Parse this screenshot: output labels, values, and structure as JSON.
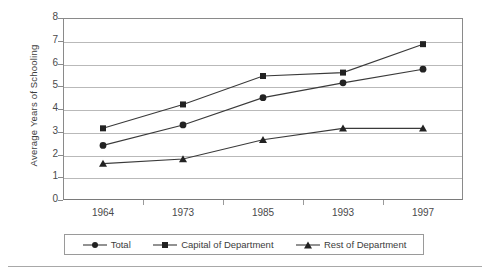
{
  "chart_data": {
    "type": "line",
    "title": "",
    "xlabel": "",
    "ylabel": "Average Years of Schooling",
    "categories": [
      "1964",
      "1973",
      "1985",
      "1993",
      "1997"
    ],
    "ylim": [
      0,
      8
    ],
    "ytick_step": 1,
    "yticks": [
      "8",
      "7",
      "6",
      "5",
      "4",
      "3",
      "2",
      "1",
      "0"
    ],
    "grid": true,
    "legend_position": "bottom",
    "series": [
      {
        "name": "Total",
        "marker": "circle",
        "values": [
          2.4,
          3.3,
          4.5,
          5.15,
          5.75
        ]
      },
      {
        "name": "Capital of Department",
        "marker": "square",
        "values": [
          3.15,
          4.2,
          5.45,
          5.6,
          6.85
        ]
      },
      {
        "name": "Rest of Department",
        "marker": "triangle",
        "values": [
          1.6,
          1.8,
          2.65,
          3.15,
          3.15
        ]
      }
    ],
    "colors": {
      "line": "#3a3a3a",
      "marker": "#222222",
      "gridline": "#b9b9b9",
      "axis": "#8a8a8a",
      "text": "#3c3c3c",
      "background": "#ffffff"
    }
  },
  "legend": {
    "items": [
      {
        "label": "Total",
        "marker": "circle-marker-icon"
      },
      {
        "label": "Capital of Department",
        "marker": "square-marker-icon"
      },
      {
        "label": "Rest of Department",
        "marker": "triangle-marker-icon"
      }
    ]
  }
}
